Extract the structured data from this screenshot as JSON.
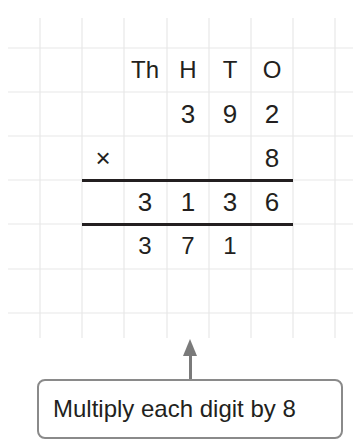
{
  "place_value_headers": [
    "Th",
    "H",
    "T",
    "O"
  ],
  "multiplicand": [
    "",
    "3",
    "9",
    "2"
  ],
  "multiplier_row": {
    "operator": "×",
    "digits": [
      "",
      "",
      "",
      "8"
    ]
  },
  "product": [
    "3",
    "1",
    "3",
    "6"
  ],
  "carries": [
    "3",
    "7",
    "1",
    ""
  ],
  "callout": {
    "text": "Multiply each digit by 8"
  },
  "colors": {
    "ink": "#231f20",
    "grid": "#e6e6e6",
    "arrow": "#7a7a7a",
    "callout_border": "#8a8a8a"
  }
}
